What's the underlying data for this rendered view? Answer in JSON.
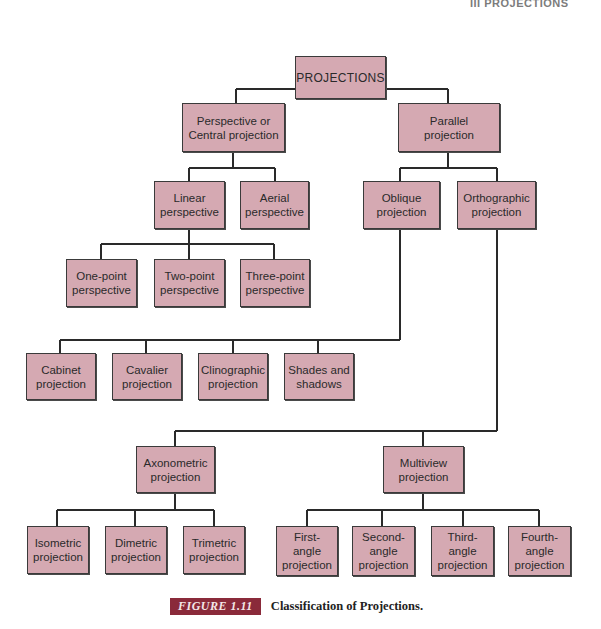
{
  "page_header": "III PROJECTIONS",
  "diagram": {
    "colors": {
      "node_fill": "#d5a9b2",
      "node_border": "#3a3a3a",
      "line": "#2a2a2a",
      "figure_tag_bg": "#8a2a3a"
    },
    "nodes": {
      "projections": "PROJECTIONS",
      "perspective": "Perspective or\nCentral projection",
      "parallel": "Parallel\nprojection",
      "linear": "Linear\nperspective",
      "aerial": "Aerial\nperspective",
      "oblique": "Oblique\nprojection",
      "orthographic": "Orthographic\nprojection",
      "one_point": "One-point\nperspective",
      "two_point": "Two-point\nperspective",
      "three_point": "Three-point\nperspective",
      "cabinet": "Cabinet\nprojection",
      "cavalier": "Cavalier\nprojection",
      "clinographic": "Clinographic\nprojection",
      "shades": "Shades and\nshadows",
      "axonometric": "Axonometric\nprojection",
      "multiview": "Multiview\nprojection",
      "isometric": "Isometric\nprojection",
      "dimetric": "Dimetric\nprojection",
      "trimetric": "Trimetric\nprojection",
      "first_angle": "First-\nangle\nprojection",
      "second_angle": "Second-\nangle\nprojection",
      "third_angle": "Third-\nangle\nprojection",
      "fourth_angle": "Fourth-\nangle\nprojection"
    },
    "edges": [
      [
        "projections",
        "perspective"
      ],
      [
        "projections",
        "parallel"
      ],
      [
        "perspective",
        "linear"
      ],
      [
        "perspective",
        "aerial"
      ],
      [
        "parallel",
        "oblique"
      ],
      [
        "parallel",
        "orthographic"
      ],
      [
        "linear",
        "one_point"
      ],
      [
        "linear",
        "two_point"
      ],
      [
        "linear",
        "three_point"
      ],
      [
        "oblique",
        "cabinet"
      ],
      [
        "oblique",
        "cavalier"
      ],
      [
        "oblique",
        "clinographic"
      ],
      [
        "oblique",
        "shades"
      ],
      [
        "orthographic",
        "axonometric"
      ],
      [
        "orthographic",
        "multiview"
      ],
      [
        "axonometric",
        "isometric"
      ],
      [
        "axonometric",
        "dimetric"
      ],
      [
        "axonometric",
        "trimetric"
      ],
      [
        "multiview",
        "first_angle"
      ],
      [
        "multiview",
        "second_angle"
      ],
      [
        "multiview",
        "third_angle"
      ],
      [
        "multiview",
        "fourth_angle"
      ]
    ]
  },
  "caption": {
    "figure_label": "FIGURE 1.11",
    "text": "Classification of Projections."
  }
}
